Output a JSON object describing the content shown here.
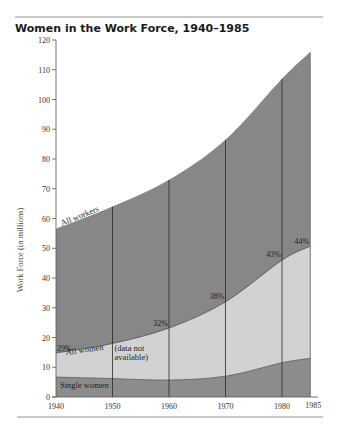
{
  "title": "Women in the Work  Force, 1940–1985",
  "colors": {
    "all_workers": "#878787",
    "all_women": "#d2d2d2",
    "single_women": "#8c8c8c",
    "line": "#2a2a2a",
    "rule": "#777777"
  },
  "chart_data": {
    "type": "area",
    "title": "Women in the Work  Force, 1940–1985",
    "xlabel": "",
    "ylabel": "Work Force (in millions)",
    "x": [
      1940,
      1950,
      1960,
      1970,
      1980,
      1985
    ],
    "x_tick_labels": [
      "1940",
      "1950",
      "1960",
      "1970",
      "1980",
      "1985"
    ],
    "y_ticks": [
      0,
      10,
      20,
      30,
      40,
      50,
      60,
      70,
      80,
      90,
      100,
      110,
      120
    ],
    "ylim": [
      0,
      120
    ],
    "grid": false,
    "vertical_lines_at": [
      1950,
      1960,
      1970,
      1980,
      1985
    ],
    "series": [
      {
        "name": "All workers",
        "values": [
          56.5,
          64,
          73,
          86.5,
          107,
          116
        ]
      },
      {
        "name": "All women",
        "values": [
          14.8,
          18,
          23.2,
          32,
          46,
          50.7
        ]
      },
      {
        "name": "Single women",
        "values": [
          6.7,
          6.2,
          5.7,
          7,
          11.5,
          13
        ]
      }
    ],
    "annotations": [
      {
        "text": "29%",
        "year": 1940,
        "value": 15.5
      },
      {
        "text": "32%",
        "year": 1960,
        "value": 24
      },
      {
        "text": "38%",
        "year": 1970,
        "value": 33
      },
      {
        "text": "43%",
        "year": 1980,
        "value": 47
      },
      {
        "text": "44%",
        "year": 1985,
        "value": 51.5
      },
      {
        "text": "(data not",
        "year": 1950,
        "value": 15.5
      },
      {
        "text": "available)",
        "year": 1950,
        "value": 12.5
      }
    ],
    "series_labels": {
      "all_workers": "All workers",
      "all_women": "All women",
      "single_women": "Single women"
    }
  }
}
